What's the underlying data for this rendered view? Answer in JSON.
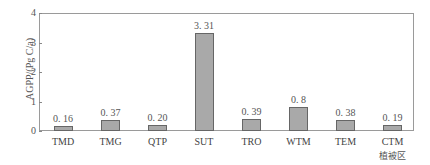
{
  "chart_data": {
    "type": "bar",
    "title": "",
    "xlabel": "",
    "ylabel": "AGPP/(Pg C/a)",
    "ylim": [
      0,
      4
    ],
    "yticks": [
      "0",
      "1",
      "2",
      "3",
      "4"
    ],
    "grid": false,
    "legend": null,
    "categories": [
      "TMD",
      "TMG",
      "QTP",
      "SUT",
      "TRO",
      "WTM",
      "TEM",
      "CTM"
    ],
    "category_sublabels": [
      "",
      "",
      "",
      "",
      "",
      "",
      "",
      "植被区"
    ],
    "values": [
      0.16,
      0.37,
      0.2,
      3.31,
      0.39,
      0.8,
      0.38,
      0.19
    ],
    "value_labels": [
      "0. 16",
      "0. 37",
      "0. 20",
      "3. 31",
      "0. 39",
      "0. 8",
      "0. 38",
      "0. 19"
    ],
    "bar_color": "#a9a9a9",
    "bar_edge_color": "#666666"
  }
}
